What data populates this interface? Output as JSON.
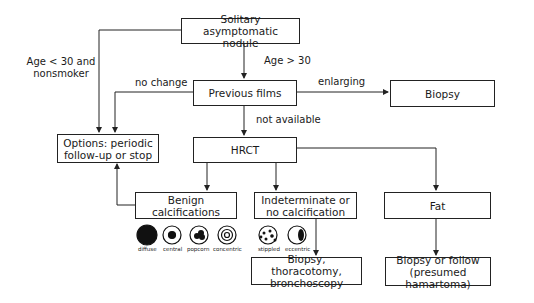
{
  "nodes": {
    "start": "Solitary asymptomatic nodule",
    "previous_films": "Previous films",
    "biopsy": "Biopsy",
    "options": "Options: periodic follow-up or stop",
    "hrct": "HRCT",
    "benign": "Benign calcifications",
    "indeterminate": "Indeterminate or no calcification",
    "fat": "Fat",
    "biopsy_thoracotomy": "Biopsy, thoracotomy, bronchoscopy",
    "biopsy_follow": "Biopsy or follow (presumed hamartoma)"
  },
  "edge_labels": {
    "age_lt_30": "Age < 30 and nonsmoker",
    "age_gt_30": "Age > 30",
    "no_change": "no change",
    "enlarging": "enlarging",
    "not_available": "not available"
  },
  "calcification_patterns": {
    "benign": [
      "diffuse",
      "central",
      "popcorn",
      "concentric"
    ],
    "indeterminate": [
      "stippled",
      "eccentric"
    ]
  }
}
